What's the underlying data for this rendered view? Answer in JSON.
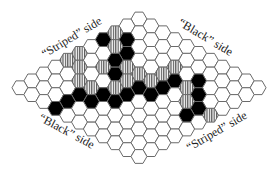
{
  "figure": {
    "board_size": 11,
    "colors": {
      "empty": "#ffffff",
      "black": "#000000",
      "stripe": "#555555",
      "edge": "#6a6a6a"
    }
  },
  "labels": {
    "top_left": "“Striped” side",
    "top_right": "“Black” side",
    "bottom_left": "“Black” side",
    "bottom_right": "“Striped” side"
  },
  "cells": {
    "black": [
      [
        3,
        0
      ],
      [
        2,
        1
      ],
      [
        3,
        2
      ],
      [
        4,
        2
      ],
      [
        5,
        3
      ],
      [
        6,
        5
      ],
      [
        7,
        4
      ],
      [
        7,
        5
      ],
      [
        8,
        3
      ],
      [
        8,
        4
      ],
      [
        9,
        3
      ],
      [
        10,
        3
      ],
      [
        5,
        5
      ],
      [
        5,
        6
      ],
      [
        4,
        6
      ],
      [
        3,
        6
      ],
      [
        2,
        7
      ],
      [
        3,
        8
      ],
      [
        4,
        9
      ],
      [
        5,
        9
      ]
    ],
    "striped": [
      [
        2,
        0
      ],
      [
        3,
        1
      ],
      [
        5,
        0
      ],
      [
        6,
        0
      ],
      [
        6,
        1
      ],
      [
        5,
        2
      ],
      [
        4,
        3
      ],
      [
        7,
        2
      ],
      [
        7,
        3
      ],
      [
        6,
        4
      ],
      [
        5,
        4
      ],
      [
        4,
        4
      ],
      [
        4,
        5
      ],
      [
        3,
        5
      ],
      [
        2,
        5
      ],
      [
        3,
        7
      ],
      [
        4,
        8
      ],
      [
        4,
        10
      ]
    ]
  }
}
